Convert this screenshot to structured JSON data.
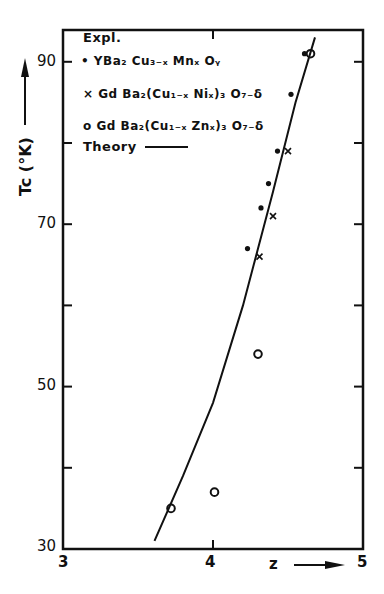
{
  "chart_data": {
    "type": "scatter",
    "title": "",
    "xlabel": "z",
    "ylabel": "Tc (°K)",
    "xlim": [
      3,
      5
    ],
    "ylim": [
      30,
      95
    ],
    "x_ticks": [
      3,
      4,
      5
    ],
    "y_ticks": [
      30,
      50,
      70,
      90
    ],
    "y_minor_ticks": [
      40,
      60,
      80
    ],
    "grid": false,
    "legend_position": "upper-left inside",
    "legend_title": "Expl.",
    "series": [
      {
        "name": "YBa2 Cu3-x Mnx Oy",
        "marker": "dot",
        "points": [
          {
            "z": 4.61,
            "tc": 91
          },
          {
            "z": 4.52,
            "tc": 86
          },
          {
            "z": 4.43,
            "tc": 79
          },
          {
            "z": 4.37,
            "tc": 75
          },
          {
            "z": 4.32,
            "tc": 72
          },
          {
            "z": 4.23,
            "tc": 67
          }
        ]
      },
      {
        "name": "Gd Ba2(Cu1-x Nix)3 O7-δ",
        "marker": "x",
        "points": [
          {
            "z": 4.5,
            "tc": 79
          },
          {
            "z": 4.4,
            "tc": 71
          },
          {
            "z": 4.31,
            "tc": 66
          }
        ]
      },
      {
        "name": "Gd Ba2(Cu1-x Znx)3 O7-δ",
        "marker": "circle",
        "points": [
          {
            "z": 4.65,
            "tc": 91
          },
          {
            "z": 4.3,
            "tc": 54
          },
          {
            "z": 4.01,
            "tc": 37
          },
          {
            "z": 3.72,
            "tc": 35
          }
        ]
      },
      {
        "name": "Theory",
        "marker": "line",
        "points": [
          {
            "z": 3.61,
            "tc": 31
          },
          {
            "z": 3.8,
            "tc": 39
          },
          {
            "z": 4.0,
            "tc": 48
          },
          {
            "z": 4.2,
            "tc": 60
          },
          {
            "z": 4.4,
            "tc": 74
          },
          {
            "z": 4.55,
            "tc": 85
          },
          {
            "z": 4.68,
            "tc": 93
          }
        ]
      }
    ]
  },
  "axes": {
    "y_label_text": "Tc (°K)",
    "x_label_text": "z",
    "y_tick_labels": [
      "90",
      "70",
      "50",
      "30"
    ],
    "x_tick_labels": [
      "3",
      "4",
      "5"
    ]
  },
  "legend": {
    "title": "Expl.",
    "entries": [
      {
        "marker": "•",
        "text": "YBa₂ Cu₃₋ₓ Mnₓ Oᵧ"
      },
      {
        "marker": "×",
        "text": "Gd Ba₂(Cu₁₋ₓ Niₓ)₃ O₇₋δ"
      },
      {
        "marker": "o",
        "text": "Gd Ba₂(Cu₁₋ₓ Znₓ)₃ O₇₋δ"
      },
      {
        "marker": "—",
        "text": "Theory"
      }
    ]
  }
}
